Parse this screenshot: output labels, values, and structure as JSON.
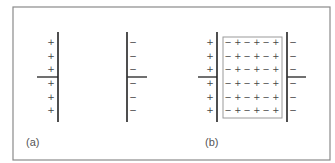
{
  "figure": {
    "panels": [
      {
        "id": "a",
        "label": "(a)",
        "description": "Parallel-plate capacitor without dielectric",
        "left_plate": {
          "charge_symbol": "+",
          "count": 6
        },
        "right_plate": {
          "charge_symbol": "−",
          "count": 6
        }
      },
      {
        "id": "b",
        "label": "(b)",
        "description": "Parallel-plate capacitor with polarized dielectric slab",
        "left_plate": {
          "charge_symbol": "+",
          "count": 6
        },
        "right_plate": {
          "charge_symbol": "−",
          "count": 6
        },
        "dielectric": {
          "rows": 6,
          "dipoles_per_row": 3,
          "dipole": "− +"
        }
      }
    ],
    "symbols": {
      "plus": "+",
      "minus": "−"
    },
    "colors": {
      "frame": "#8a8a8a",
      "plate": "#222222",
      "text": "#444444"
    }
  }
}
